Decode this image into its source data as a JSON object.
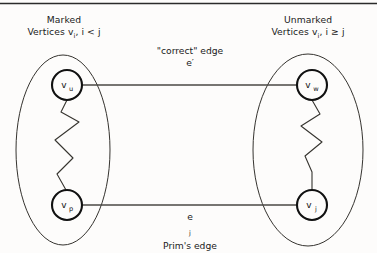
{
  "figure": {
    "title_rule": "top-horizontal-rule",
    "background_color": "#fdfcfb",
    "ink_color": "#1a1a1a"
  },
  "groups": {
    "left": {
      "name": "marked-set",
      "heading": "Marked",
      "subheading": "Vertices vᵢ, i < j",
      "heading_line1": "Marked",
      "heading_line2_prefix": "Vertices v",
      "heading_line2_sub": "i",
      "heading_line2_suffix": ", i < j"
    },
    "right": {
      "name": "unmarked-set",
      "heading": "Unmarked",
      "subheading": "Vertices vᵢ, i ≥ j",
      "heading_line1": "Unmarked",
      "heading_line2_prefix": "Vertices v",
      "heading_line2_sub": "i",
      "heading_line2_suffix": ", i ≥ j"
    }
  },
  "nodes": [
    {
      "id": "v_u",
      "base": "v",
      "sub": "u",
      "group": "left",
      "cx": 67,
      "cy": 85,
      "r": 15
    },
    {
      "id": "v_p",
      "base": "v",
      "sub": "p",
      "group": "left",
      "cx": 67,
      "cy": 205,
      "r": 15
    },
    {
      "id": "v_w",
      "base": "v",
      "sub": "w",
      "group": "right",
      "cx": 312,
      "cy": 85,
      "r": 15
    },
    {
      "id": "v_j",
      "base": "v",
      "sub": "j",
      "group": "right",
      "cx": 312,
      "cy": 205,
      "r": 15
    }
  ],
  "edges": {
    "correct": {
      "id": "correct-edge",
      "from": "v_u",
      "to": "v_w",
      "label_line1": "\"correct\" edge",
      "label_line2": "e′"
    },
    "prims": {
      "id": "prims-edge",
      "from": "v_p",
      "to": "v_j",
      "label_line1": "e",
      "label_line1_sub": "j",
      "label_line2": "Prim's edge"
    }
  },
  "paths": {
    "left_zigzag": {
      "name": "left-tree-path",
      "from": "v_u",
      "to": "v_p",
      "points": "67,100 61,112 79,122 55,140 73,158 57,174 66,190"
    },
    "right_zigzag": {
      "name": "right-tree-path",
      "from": "v_w",
      "to": "v_j",
      "points": "312,100 320,114 301,126 322,142 305,156 312,172 312,190"
    }
  },
  "ellipses": [
    {
      "name": "left-set-ellipse",
      "cx": 63,
      "cy": 150,
      "rx": 47,
      "ry": 95
    },
    {
      "name": "right-set-ellipse",
      "cx": 308,
      "cy": 150,
      "rx": 55,
      "ry": 96
    }
  ]
}
